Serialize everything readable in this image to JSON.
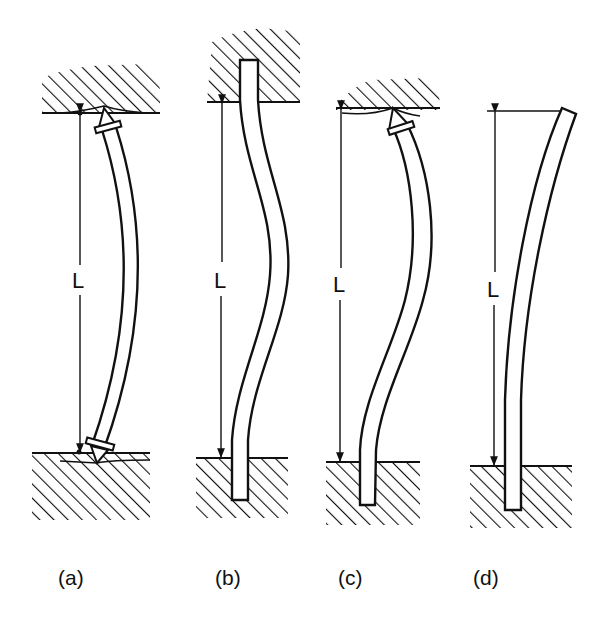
{
  "figure": {
    "length_label": "L",
    "panels": [
      {
        "id": "a",
        "caption": "(a)",
        "top_support": "pinned",
        "bottom_support": "pinned",
        "deflected_shape": "single-bow"
      },
      {
        "id": "b",
        "caption": "(b)",
        "top_support": "fixed",
        "bottom_support": "fixed",
        "deflected_shape": "double-curvature"
      },
      {
        "id": "c",
        "caption": "(c)",
        "top_support": "pinned",
        "bottom_support": "fixed",
        "deflected_shape": "s-curve"
      },
      {
        "id": "d",
        "caption": "(d)",
        "top_support": "free",
        "bottom_support": "fixed",
        "deflected_shape": "cantilever-sway"
      }
    ]
  },
  "colors": {
    "ink": "#111111",
    "background": "#ffffff"
  }
}
